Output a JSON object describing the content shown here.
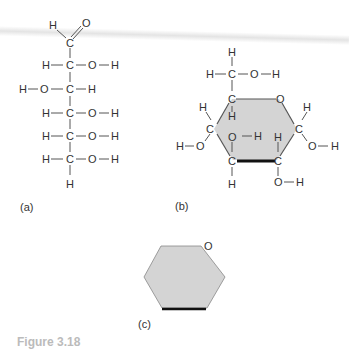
{
  "figure": {
    "caption": "Figure 3.18",
    "panels": [
      {
        "id": "a",
        "label": "(a)",
        "description": "Open-chain (Fischer projection) glucose"
      },
      {
        "id": "b",
        "label": "(b)",
        "description": "Ring (Haworth) glucose"
      },
      {
        "id": "c",
        "label": "(c)",
        "description": "Simplified hexagon ring with oxygen"
      }
    ]
  },
  "panel_a": {
    "top": {
      "H": "H",
      "C": "C",
      "O": "O"
    },
    "rows": [
      {
        "left": "H",
        "center": "C",
        "right": "O — H"
      },
      {
        "left": "H — O",
        "center": "C",
        "right": "H"
      },
      {
        "left": "H",
        "center": "C",
        "right": "O — H"
      },
      {
        "left": "H",
        "center": "C",
        "right": "O — H"
      },
      {
        "left": "H",
        "center": "C",
        "right": "O — H"
      }
    ],
    "bottom": "H"
  },
  "panel_b": {
    "ring_oxygen": "O",
    "atoms": {
      "C": "C",
      "H": "H",
      "O": "O"
    }
  },
  "panel_c": {
    "ring_oxygen": "O"
  },
  "colors": {
    "ring_fill": "#d4d4d4",
    "line": "#555555",
    "bold_edge": "#111111"
  }
}
